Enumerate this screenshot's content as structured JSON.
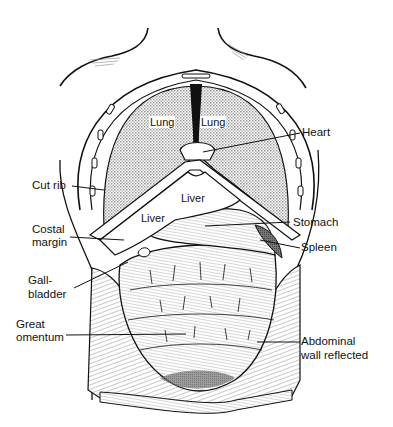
{
  "figure": {
    "colors": {
      "ink": "#111111",
      "stipple": "#bdbdbd",
      "dark_stipple": "#8a8a8a",
      "background": "#ffffff"
    }
  },
  "organ_labels": {
    "lung_left": "Lung",
    "lung_right": "Lung",
    "liver_upper": "Liver",
    "liver_lower": "Liver"
  },
  "callouts": {
    "heart": "Heart",
    "cut_rib": "Cut rib",
    "costal_margin_1": "Costal",
    "costal_margin_2": "margin",
    "stomach": "Stomach",
    "spleen": "Spleen",
    "gallbladder_1": "Gall-",
    "gallbladder_2": "bladder",
    "great_omentum_1": "Great",
    "great_omentum_2": "omentum",
    "abdominal_wall_1": "Abdominal",
    "abdominal_wall_2": "wall reflected"
  }
}
